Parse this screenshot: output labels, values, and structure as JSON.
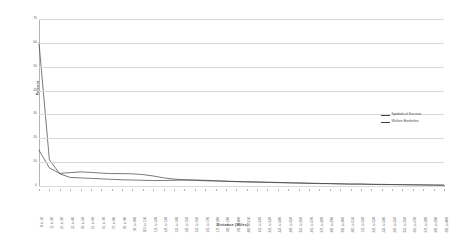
{
  "chart_data": {
    "type": "line",
    "title": "",
    "xlabel": "Distance (Miles)",
    "ylabel": "Percent",
    "ylim": [
      0,
      70
    ],
    "yticks": [
      0,
      10,
      20,
      30,
      40,
      50,
      60,
      70
    ],
    "grid": true,
    "legend_position": "right",
    "categories": [
      "0 to 10",
      "11 to 20",
      "21 to 30",
      "31 to 40",
      "41 to 50",
      "51 to 60",
      "61 to 70",
      "71 to 80",
      "81 to 90",
      "91 to 100",
      "101 to 110",
      "111 to 120",
      "121 to 130",
      "131 to 140",
      "141 to 150",
      "151 to 160",
      "161 to 170",
      "171 to 180",
      "181 to 190",
      "191 to 200",
      "201 to 210",
      "211 to 220",
      "221 to 230",
      "231 to 240",
      "241 to 250",
      "251 to 260",
      "261 to 270",
      "271 to 280",
      "281 to 290",
      "291 to 300",
      "301 to 310",
      "311 to 320",
      "321 to 330",
      "331 to 340",
      "341 to 350",
      "351 to 360",
      "361 to 370",
      "371 to 380",
      "381 to 390",
      "391 to 400"
    ],
    "series": [
      {
        "name": "Symbols of Success",
        "color": "#404040",
        "values": [
          15.0,
          7.6,
          5.3,
          5.6,
          5.9,
          5.7,
          5.4,
          5.2,
          5.2,
          5.1,
          4.8,
          4.2,
          3.4,
          2.9,
          2.6,
          2.4,
          2.2,
          2.1,
          2.0,
          1.9,
          1.8,
          1.7,
          1.6,
          1.5,
          1.4,
          1.3,
          1.2,
          1.1,
          1.0,
          0.9,
          0.8,
          0.8,
          0.7,
          0.7,
          0.6,
          0.6,
          0.5,
          0.5,
          0.4,
          0.4
        ]
      },
      {
        "name": "Welfare Borderline",
        "color": "#404040",
        "values": [
          60.0,
          11.0,
          5.1,
          3.6,
          3.4,
          3.2,
          3.0,
          2.8,
          2.6,
          2.5,
          2.4,
          2.3,
          2.3,
          2.4,
          2.5,
          2.5,
          2.4,
          2.2,
          2.0,
          1.8,
          1.7,
          1.6,
          1.5,
          1.4,
          1.3,
          1.2,
          1.1,
          1.0,
          1.0,
          0.9,
          0.8,
          0.8,
          0.7,
          0.6,
          0.6,
          0.5,
          0.5,
          0.4,
          0.4,
          0.3
        ]
      }
    ]
  },
  "legend": {
    "entries": [
      {
        "label": "Symbols of Success"
      },
      {
        "label": "Welfare Borderline"
      }
    ]
  }
}
